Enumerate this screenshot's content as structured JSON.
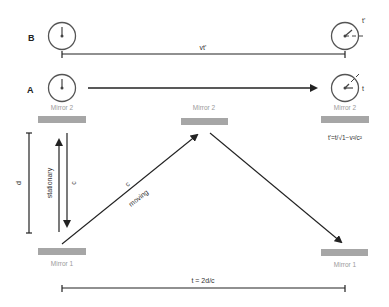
{
  "rows": {
    "b_label": "B",
    "a_label": "A"
  },
  "labels": {
    "vt_prime": "vt'",
    "t_prime": "t'",
    "t": "t",
    "mirror2_left": "Mirror 2",
    "mirror2_center": "Mirror 2",
    "mirror2_right": "Mirror 2",
    "mirror1_left": "Mirror 1",
    "mirror1_right": "Mirror 1",
    "dilation_formula": "t'=t/√1−v²/c²",
    "d": "d",
    "c_vertical": "c",
    "stationary": "stationary",
    "c_diagonal": "c",
    "moving": "moving",
    "total_time": "t = 2d/c"
  },
  "colors": {
    "line": "#222222",
    "mirror": "#a6a6a6",
    "mirror_text": "#9a9a9a",
    "text": "#333333"
  }
}
